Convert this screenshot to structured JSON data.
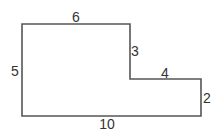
{
  "diagram": {
    "type": "rectilinear-polygon",
    "stroke_color": "#555555",
    "fill_color": "#ffffff",
    "vertices": [
      [
        22,
        24
      ],
      [
        130,
        24
      ],
      [
        130,
        79
      ],
      [
        201,
        79
      ],
      [
        201,
        116
      ],
      [
        22,
        116
      ]
    ],
    "edges": [
      {
        "name": "top",
        "label": "6",
        "x": 76,
        "y": 18
      },
      {
        "name": "inner-vertical",
        "label": "3",
        "x": 135,
        "y": 51
      },
      {
        "name": "step-horizontal",
        "label": "4",
        "x": 165,
        "y": 73
      },
      {
        "name": "right",
        "label": "2",
        "x": 207,
        "y": 98
      },
      {
        "name": "bottom",
        "label": "10",
        "x": 107,
        "y": 124
      },
      {
        "name": "left",
        "label": "5",
        "x": 15,
        "y": 71
      }
    ]
  }
}
